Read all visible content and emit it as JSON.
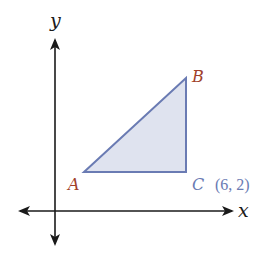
{
  "axes": {
    "x_label": "x",
    "y_label": "y",
    "color": "#1a1a1a"
  },
  "triangle": {
    "fill": "#dfe3ef",
    "stroke": "#6a7bb3",
    "vertices": [
      {
        "name": "A",
        "label": "A",
        "color": "#a0402a"
      },
      {
        "name": "B",
        "label": "B",
        "color": "#a0402a"
      },
      {
        "name": "C",
        "label": "C",
        "color": "#6a7bb3"
      }
    ]
  },
  "annotations": {
    "c_coordinates": "(6, 2)",
    "c_coordinates_color": "#6a7bb3"
  }
}
